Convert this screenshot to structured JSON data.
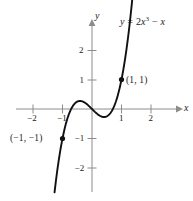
{
  "figure": {
    "background_color": "#ffffff",
    "ink_color": "#1b1b1b",
    "axis_color": "#8c8c8c",
    "curve_color": "#111111"
  },
  "axes": {
    "x_axis_label": "x",
    "y_axis_label": "y",
    "x_ticks": [
      {
        "value": -2,
        "label": "−2"
      },
      {
        "value": -1,
        "label": "−1"
      },
      {
        "value": 1,
        "label": "1"
      },
      {
        "value": 2,
        "label": "2"
      }
    ],
    "y_ticks": [
      {
        "value": 2,
        "label": "2"
      },
      {
        "value": 1,
        "label": "1"
      },
      {
        "value": -1,
        "label": "−1"
      },
      {
        "value": -2,
        "label": "−2"
      }
    ]
  },
  "equation": {
    "lhs": "y",
    "equals": "=",
    "coefficient": "2",
    "variable": "x",
    "exponent": "3",
    "operator": "−",
    "term": "x",
    "full_text": "y = 2x³ − x"
  },
  "points": [
    {
      "id": "point-neg1",
      "label": "(−1, −1)",
      "x": -1,
      "y": -1
    },
    {
      "id": "point-pos1",
      "label": "(1, 1)",
      "x": 1,
      "y": 1
    }
  ],
  "chart_data": {
    "type": "line",
    "title": "",
    "subtitle": "",
    "xlabel": "x",
    "ylabel": "y",
    "xlim": [
      -2.6,
      2.9
    ],
    "ylim": [
      -3.1,
      2.95
    ],
    "xticks": [
      -2,
      -1,
      1,
      2
    ],
    "yticks": [
      2,
      1,
      -1,
      -2
    ],
    "grid": false,
    "legend": null,
    "annotations": [
      {
        "text": "y = 2x³ − x",
        "x": 1.75,
        "y": 2.7
      },
      {
        "text": "(1, 1)",
        "x": 1.22,
        "y": 1.0
      },
      {
        "text": "(−1, −1)",
        "x": -1.85,
        "y": -1.0
      }
    ],
    "series": [
      {
        "name": "y = 2x³ − x",
        "formula": "y = 2*x**3 - x",
        "x": [
          -1.27,
          -1.2,
          -1.1,
          -1.0,
          -0.9,
          -0.8,
          -0.7,
          -0.6,
          -0.5,
          -0.408,
          -0.3,
          -0.2,
          -0.1,
          0.0,
          0.1,
          0.2,
          0.3,
          0.408,
          0.5,
          0.6,
          0.7,
          0.8,
          0.9,
          1.0,
          1.1,
          1.2,
          1.3,
          1.4
        ],
        "y": [
          -2.828,
          -2.256,
          -1.562,
          -1.0,
          -0.558,
          -0.224,
          0.014,
          0.168,
          0.25,
          0.272,
          0.246,
          0.184,
          0.098,
          0.0,
          -0.098,
          -0.184,
          -0.246,
          -0.272,
          -0.25,
          -0.168,
          -0.014,
          0.224,
          0.558,
          1.0,
          1.562,
          2.256,
          2.094,
          3.083
        ],
        "marked_points": [
          {
            "x": -1,
            "y": -1,
            "label": "(−1, −1)"
          },
          {
            "x": 1,
            "y": 1,
            "label": "(1, 1)"
          }
        ],
        "local_max": {
          "x": -0.408,
          "y": 0.272
        },
        "local_min": {
          "x": 0.408,
          "y": -0.272
        },
        "roots": [
          -0.7071,
          0,
          0.7071
        ]
      }
    ]
  }
}
